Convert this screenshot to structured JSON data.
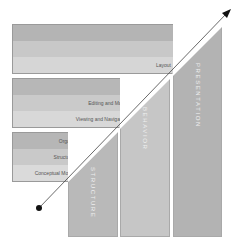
{
  "diagram": {
    "columns": [
      {
        "id": "structure",
        "label": "STRUCTURE",
        "color": "#b9b9b9"
      },
      {
        "id": "behavior",
        "label": "BEHAVIOR",
        "color": "#c6c6c6"
      },
      {
        "id": "presentation",
        "label": "PRESENTATION",
        "color": "#b3b3b3"
      }
    ],
    "panels": [
      {
        "id": "presentation",
        "rows": [
          {
            "label": "Text",
            "color": "#b4b4b4"
          },
          {
            "label": "Style",
            "color": "#c8c8c8"
          },
          {
            "label": "Layout",
            "color": "#d6d6d6"
          }
        ]
      },
      {
        "id": "behavior",
        "rows": [
          {
            "label": "User Assistance",
            "color": "#b7b7b7"
          },
          {
            "label": "Editing and Manipulation",
            "color": "#cacaca"
          },
          {
            "label": "Viewing and Navigation",
            "color": "#d8d8d8"
          }
        ]
      },
      {
        "id": "structure",
        "rows": [
          {
            "label": "Organizational Model",
            "color": "#b6b6b6"
          },
          {
            "label": "Structural Model",
            "color": "#c9c9c9"
          },
          {
            "label": "Conceptual Model",
            "color": "#dadada"
          }
        ]
      }
    ],
    "arrow": {
      "start_marker": "dot",
      "end_marker": "arrowhead",
      "color": "#444444"
    }
  }
}
